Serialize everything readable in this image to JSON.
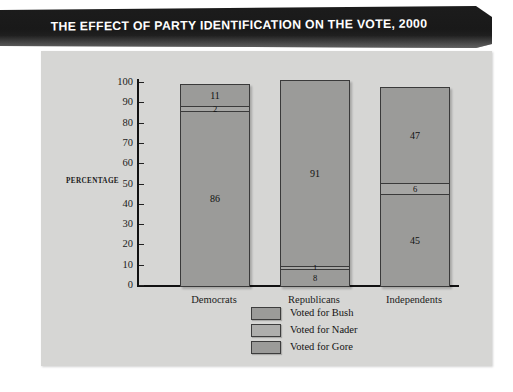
{
  "title": "THE EFFECT OF PARTY IDENTIFICATION ON THE VOTE, 2000",
  "axis": {
    "y_title": "PERCENTAGE",
    "ticks": [
      "100",
      "90",
      "80",
      "70",
      "60",
      "50",
      "40",
      "30",
      "20",
      "10",
      "0"
    ]
  },
  "legend": {
    "items": [
      {
        "label": "Voted for Bush",
        "color": "#9b9b99"
      },
      {
        "label": "Voted for Nader",
        "color": "#a6a6a4"
      },
      {
        "label": "Voted for Gore",
        "color": "#9b9b99"
      }
    ]
  },
  "bars": {
    "democrats": {
      "label": "Democrats",
      "bush": "11",
      "nader": "2",
      "gore": "86"
    },
    "republicans": {
      "label": "Republicans",
      "bush": "91",
      "nader": "1",
      "gore": "8"
    },
    "independents": {
      "label": "Independents",
      "bush": "47",
      "nader": "6",
      "gore": "45"
    }
  },
  "chart_data": {
    "type": "bar",
    "title": "THE EFFECT OF PARTY IDENTIFICATION ON THE VOTE, 2000",
    "subtitle": "",
    "xlabel": "",
    "ylabel": "PERCENTAGE",
    "ylim": [
      0,
      100
    ],
    "yticks": [
      0,
      10,
      20,
      30,
      40,
      50,
      60,
      70,
      80,
      90,
      100
    ],
    "grid": false,
    "stacked": true,
    "legend_position": "bottom-center",
    "categories": [
      "Democrats",
      "Republicans",
      "Independents"
    ],
    "series": [
      {
        "name": "Voted for Bush",
        "values": [
          11,
          91,
          47
        ],
        "color": "#9b9b99"
      },
      {
        "name": "Voted for Nader",
        "values": [
          2,
          1,
          6
        ],
        "color": "#a6a6a4"
      },
      {
        "name": "Voted for Gore",
        "values": [
          86,
          8,
          45
        ],
        "color": "#9b9b99"
      }
    ],
    "stack_order_top_to_bottom": [
      "Voted for Bush",
      "Voted for Nader",
      "Voted for Gore"
    ],
    "totals": [
      99,
      100,
      98
    ],
    "data_labels": [
      {
        "category": "Democrats",
        "Voted for Bush": 11,
        "Voted for Nader": 2,
        "Voted for Gore": 86
      },
      {
        "category": "Republicans",
        "Voted for Bush": 91,
        "Voted for Nader": 1,
        "Voted for Gore": 8
      },
      {
        "category": "Independents",
        "Voted for Bush": 47,
        "Voted for Nader": 6,
        "Voted for Gore": 45
      }
    ]
  }
}
